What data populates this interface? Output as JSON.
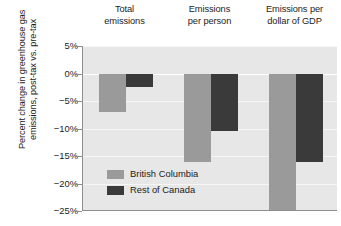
{
  "chart_data": {
    "type": "bar",
    "title": "",
    "xlabel": "",
    "ylabel_lines": [
      "Percent change in greenhouse gas",
      "emissions, post-tax vs. pre-tax"
    ],
    "categories": [
      {
        "line1": "Total",
        "line2": "emissions"
      },
      {
        "line1": "Emissions",
        "line2": "per person"
      },
      {
        "line1": "Emissions per",
        "line2": "dollar of GDP"
      }
    ],
    "series": [
      {
        "name": "British Columbia",
        "color": "#9a9a9a",
        "values": [
          -7,
          -16,
          -25
        ]
      },
      {
        "name": "Rest of Canada",
        "color": "#3a3a3a",
        "values": [
          -2.5,
          -10.5,
          -16
        ]
      }
    ],
    "ylim": [
      -25,
      5
    ],
    "yticks": [
      5,
      0,
      -5,
      -10,
      -15,
      -20,
      -25
    ],
    "ytick_labels": [
      "5%",
      "0%",
      "−5%",
      "−10%",
      "−15%",
      "−20%",
      "−25%"
    ],
    "grid": true,
    "legend_position": "inside-lower-left",
    "plot_background": "#e7e7e7",
    "axis_color": "#8d8d8d"
  },
  "legend": {
    "items": [
      {
        "label": "British Columbia",
        "color": "#9a9a9a"
      },
      {
        "label": "Rest of Canada",
        "color": "#3a3a3a"
      }
    ]
  }
}
